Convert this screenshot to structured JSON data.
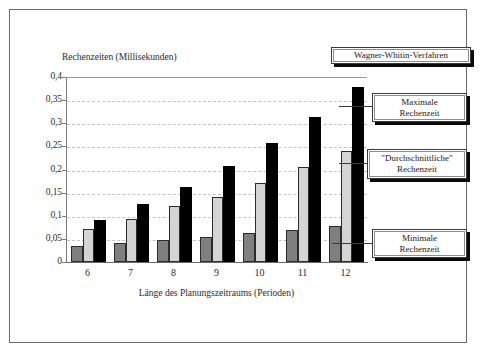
{
  "figure": {
    "background": "#ffffff",
    "frame_color": "#6b6b6b"
  },
  "chart_data": {
    "type": "bar",
    "title": "",
    "xlabel": "Länge des Planungszeitraums (Perioden)",
    "ylabel": "Rechenzeiten (Millisekunden)",
    "categories": [
      "6",
      "7",
      "8",
      "9",
      "10",
      "11",
      "12"
    ],
    "ylim": [
      0,
      0.4
    ],
    "ytick_labels": [
      "0,4",
      "0,35",
      "0,3",
      "0,25",
      "0,2",
      "0,15",
      "0,1",
      "0,05",
      "0"
    ],
    "ytick_values": [
      0.4,
      0.35,
      0.3,
      0.25,
      0.2,
      0.15,
      0.1,
      0.05,
      0
    ],
    "grid": true,
    "grid_style": "dashed",
    "legend_position": "right-callouts",
    "series": [
      {
        "name": "Minimale Rechenzeit",
        "color": "#7f7f7f",
        "values": [
          0.035,
          0.042,
          0.048,
          0.055,
          0.063,
          0.07,
          0.078
        ]
      },
      {
        "name": "\"Durchschnittliche\" Rechenzeit",
        "color": "#d4d4d4",
        "values": [
          0.072,
          0.093,
          0.122,
          0.141,
          0.171,
          0.205,
          0.24
        ]
      },
      {
        "name": "Maximale Rechenzeit",
        "color": "#000000",
        "values": [
          0.091,
          0.125,
          0.163,
          0.207,
          0.257,
          0.314,
          0.378
        ]
      }
    ]
  },
  "callouts": {
    "title": "Wagner-Whitin-Verfahren",
    "maximale": "Maximale\nRechenzeit",
    "durchschnittliche": "\"Durchschnittliche\"\nRechenzeit",
    "minimale": "Minimale\nRechenzeit"
  }
}
